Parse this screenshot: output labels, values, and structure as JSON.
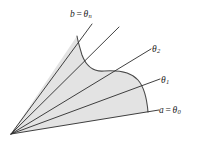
{
  "figure": {
    "type": "polar-region-diagram",
    "background_color": "#ffffff",
    "region_fill_color": "#e3e3e3",
    "region_stroke_color": "#4a4a4a",
    "ray_color": "#2b2b2b",
    "apex": {
      "x": 11,
      "y": 134
    },
    "rays": [
      {
        "name": "theta-0",
        "label_key": "a",
        "angle_deg": 14
      },
      {
        "name": "theta-1",
        "label_key": "t1",
        "angle_deg": 24
      },
      {
        "name": "theta-2",
        "label_key": "t2",
        "angle_deg": 34
      },
      {
        "name": "theta-mid",
        "label_key": null,
        "angle_deg": 45
      },
      {
        "name": "theta-n",
        "label_key": "b",
        "angle_deg": 57
      }
    ],
    "labels": {
      "b": {
        "var": "b",
        "eq": "=",
        "theta": "θ",
        "sub": "n",
        "full": "b = θₙ"
      },
      "t2": {
        "var": "",
        "eq": "",
        "theta": "θ",
        "sub": "2",
        "full": "θ₂"
      },
      "t1": {
        "var": "",
        "eq": "",
        "theta": "θ",
        "sub": "1",
        "full": "θ₁"
      },
      "a": {
        "var": "a",
        "eq": "=",
        "theta": "θ",
        "sub": "0",
        "full": "a = θ₀"
      }
    }
  }
}
